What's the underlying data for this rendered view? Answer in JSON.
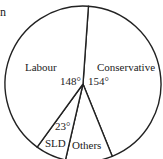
{
  "fragment_text": "n",
  "chart_data": {
    "type": "pie",
    "title": "",
    "unit": "degrees",
    "start_angle_deg": 4,
    "direction": "clockwise",
    "categories": [
      "Conservative",
      "Others",
      "SLD",
      "Labour"
    ],
    "values": [
      154,
      35,
      23,
      148
    ],
    "labels": {
      "Conservative": {
        "name": "Conservative",
        "angle": "154°"
      },
      "Labour": {
        "name": "Labour",
        "angle": "148°"
      },
      "SLD": {
        "name": "SLD",
        "angle": "23°"
      },
      "Others": {
        "name": "Others",
        "angle": ""
      }
    },
    "fill": "#ffffff",
    "stroke": "#222222",
    "legend": "none"
  }
}
